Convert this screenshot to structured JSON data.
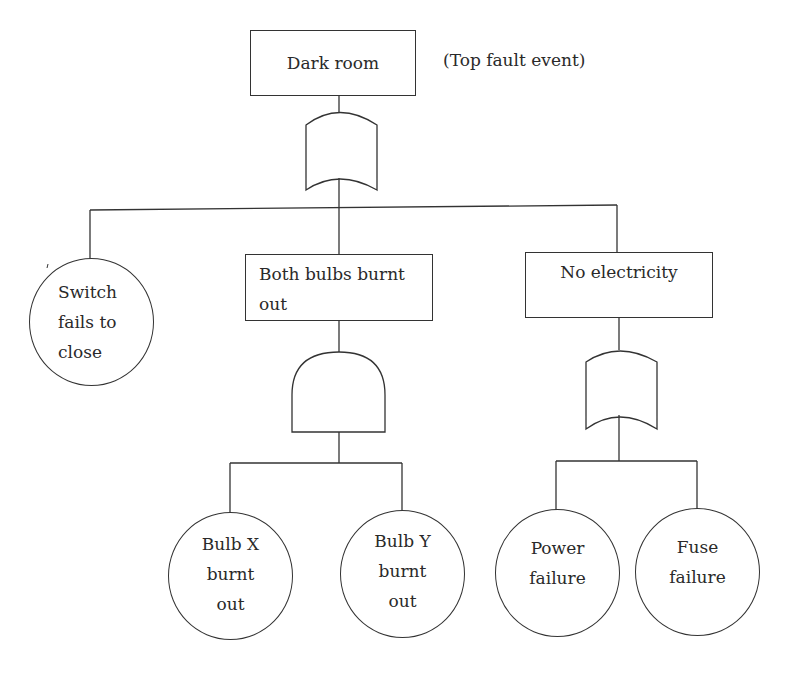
{
  "diagram": {
    "type": "fault-tree",
    "top_event": {
      "label": "Dark room",
      "annotation": "(Top fault event)",
      "gate": "OR"
    },
    "intermediate_events": [
      {
        "label": "Both bulbs burnt\nout",
        "gate": "AND",
        "children": [
          "Bulb X\nburnt\nout",
          "Bulb Y\nburnt\nout"
        ]
      },
      {
        "label": "No electricity",
        "gate": "OR",
        "children": [
          "Power\nfailure",
          "Fuse\nfailure"
        ]
      }
    ],
    "basic_events": {
      "switch": "Switch\nfails to\nclose",
      "bulb_x": "Bulb X\nburnt\nout",
      "bulb_y": "Bulb Y\nburnt\nout",
      "power": "Power\nfailure",
      "fuse": "Fuse\nfailure"
    },
    "colors": {
      "line": "#333333",
      "text": "#2a2a2a",
      "background": "#ffffff"
    }
  }
}
